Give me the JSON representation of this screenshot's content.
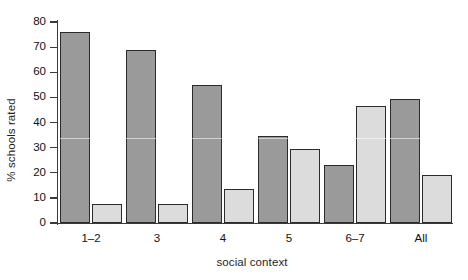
{
  "chart_data": {
    "type": "bar",
    "title": "",
    "xlabel": "social context",
    "ylabel": "% schools rated",
    "categories": [
      "1–2",
      "3",
      "4",
      "5",
      "6–7",
      "All"
    ],
    "series": [
      {
        "name": "dark-series",
        "color": "#9a9a9a",
        "values": [
          76,
          69,
          55,
          34.5,
          23,
          49.5
        ]
      },
      {
        "name": "light-series",
        "color": "#dcdcdc",
        "values": [
          7.5,
          7.5,
          13.5,
          29.5,
          46.5,
          19
        ]
      }
    ],
    "ylim": [
      0,
      80
    ],
    "yticks": [
      0,
      10,
      20,
      30,
      40,
      50,
      60,
      70,
      80
    ],
    "ytick_labels": [
      "0",
      "10",
      "20",
      "30",
      "40",
      "50",
      "60",
      "70",
      "80"
    ],
    "grid": false,
    "legend": "none",
    "axis_color": "#3a3a3a",
    "bar_edge_color": "#2b2b2b",
    "background": "#ffffff"
  }
}
